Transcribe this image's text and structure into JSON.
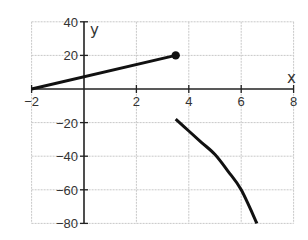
{
  "chart_data": {
    "type": "line",
    "title": "",
    "xlabel": "x",
    "ylabel": "y",
    "xlim": [
      -2,
      8
    ],
    "ylim": [
      -80,
      40
    ],
    "grid": true,
    "x_ticks": [
      -2,
      2,
      4,
      6,
      8
    ],
    "x_tick_labels": [
      "−2",
      "2",
      "4",
      "6",
      "8"
    ],
    "y_ticks": [
      40,
      20,
      -20,
      -40,
      -60,
      -80
    ],
    "y_tick_labels": [
      "40",
      "20",
      "−20",
      "−40",
      "−60",
      "−80"
    ],
    "series": [
      {
        "name": "linear-piece",
        "kind": "segment",
        "x": [
          -2,
          0,
          3.5
        ],
        "y": [
          0,
          7.3,
          20
        ],
        "end_marker": "closed-dot",
        "end_point": [
          3.5,
          20
        ]
      },
      {
        "name": "curve-piece",
        "kind": "curve",
        "x": [
          3.5,
          4,
          4.5,
          5,
          5.5,
          6,
          6.6
        ],
        "y": [
          -18,
          -25,
          -32,
          -39,
          -49,
          -60,
          -80
        ],
        "start_marker": "none"
      }
    ]
  },
  "axes": {
    "x_label": "x",
    "y_label": "y"
  }
}
